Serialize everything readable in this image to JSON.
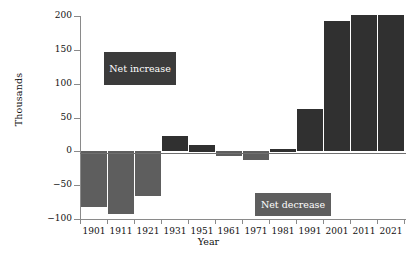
{
  "chart_data": {
    "type": "bar",
    "title": "",
    "xlabel": "Year",
    "ylabel": "Thousands",
    "categories": [
      "1901",
      "1911",
      "1921",
      "1931",
      "1951",
      "1961",
      "1971",
      "1981",
      "1991",
      "2001",
      "2011",
      "2021"
    ],
    "values": [
      -83,
      -93,
      -66,
      22,
      10,
      -8,
      -13,
      4,
      62,
      192,
      201,
      201
    ],
    "ylim": [
      -100,
      200
    ],
    "yticks": [
      -100,
      -50,
      0,
      50,
      100,
      150,
      200
    ],
    "ytick_labels": [
      "−100",
      "−50",
      "0",
      "50",
      "100",
      "150",
      "200"
    ],
    "xticks": [
      "1901",
      "1911",
      "1921",
      "1931",
      "1951",
      "1961",
      "1971",
      "1981",
      "1991",
      "2001",
      "2011",
      "2021"
    ],
    "grid": false,
    "legend": "none",
    "annotations": [
      {
        "text": "Net increase",
        "color": "#3b3b3b",
        "text_color": "#ffffff"
      },
      {
        "text": "Net decrease",
        "color": "#5e5e5e",
        "text_color": "#ffffff"
      }
    ],
    "colors": {
      "net_increase_bar": "#303030",
      "net_decrease_bar": "#5e5e5e",
      "axis": "#8a8a8a",
      "text": "#111111",
      "background": "#ffffff"
    }
  }
}
